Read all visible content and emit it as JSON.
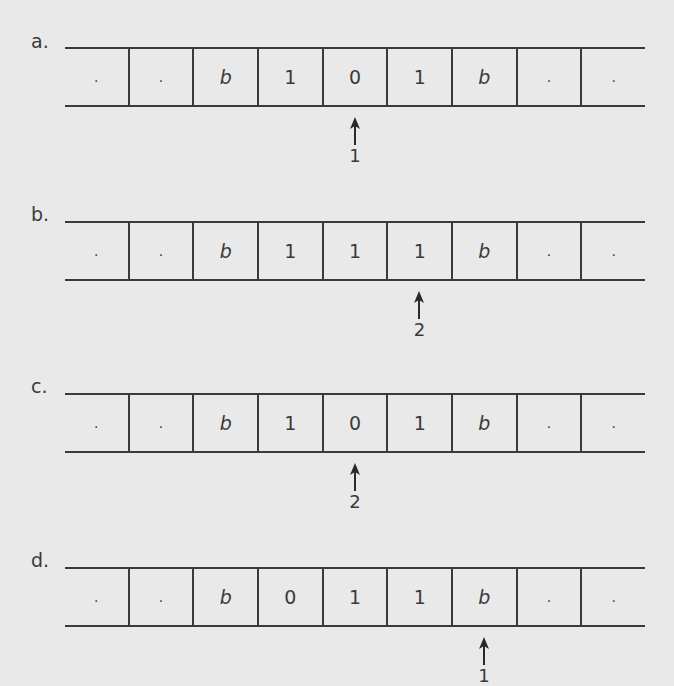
{
  "figure": {
    "tapes": [
      {
        "label": "a.",
        "cells": [
          ".",
          ".",
          "b",
          "1",
          "0",
          "1",
          "b",
          ".",
          "."
        ],
        "head_index": 4,
        "state": "1"
      },
      {
        "label": "b.",
        "cells": [
          ".",
          ".",
          "b",
          "1",
          "1",
          "1",
          "b",
          ".",
          "."
        ],
        "head_index": 5,
        "state": "2"
      },
      {
        "label": "c.",
        "cells": [
          ".",
          ".",
          "b",
          "1",
          "0",
          "1",
          "b",
          ".",
          "."
        ],
        "head_index": 4,
        "state": "2"
      },
      {
        "label": "d.",
        "cells": [
          ".",
          ".",
          "b",
          "0",
          "1",
          "1",
          "b",
          ".",
          "."
        ],
        "head_index": 6,
        "state": "1"
      }
    ]
  }
}
